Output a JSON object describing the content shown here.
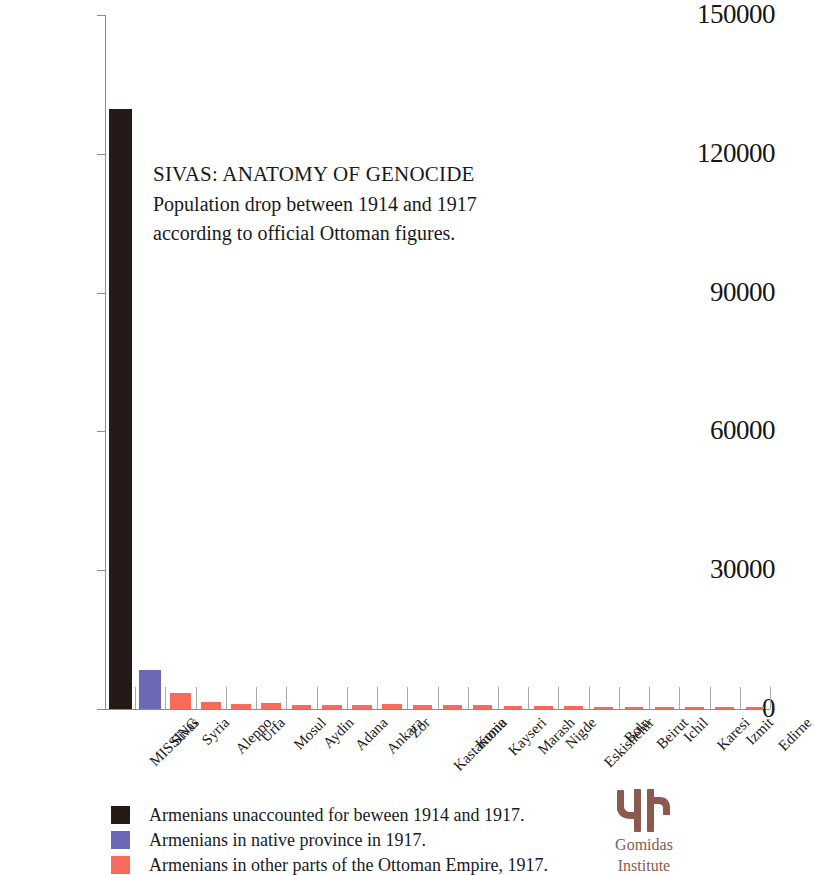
{
  "chart_data": {
    "type": "bar",
    "title": "SIVAS: ANATOMY OF GENOCIDE",
    "subtitle_lines": [
      "Population drop between 1914 and 1917",
      "according to official Ottoman figures."
    ],
    "xlabel": "",
    "ylabel": "",
    "ylim": [
      0,
      150000
    ],
    "ytick_values": [
      0,
      30000,
      60000,
      90000,
      120000,
      150000
    ],
    "ytick_labels": [
      "0",
      "30000",
      "60000",
      "90000",
      "120000",
      "150000"
    ],
    "grid": false,
    "legend_position": "below-left",
    "categories": [
      "MISSING",
      "Sivas",
      "Syria",
      "Aleppo",
      "Urfa",
      "Mosul",
      "Aydin",
      "Adana",
      "Ankara",
      "Zor",
      "Kastamonu",
      "Konia",
      "Kayseri",
      "Marash",
      "Nigde",
      "Eskishehir",
      "Bolu",
      "Beirut",
      "Ichil",
      "Karesi",
      "Izmit",
      "Edirne"
    ],
    "values": [
      129700,
      8400,
      3500,
      1500,
      1100,
      1300,
      900,
      900,
      800,
      1000,
      800,
      800,
      900,
      700,
      600,
      600,
      500,
      500,
      400,
      400,
      350,
      300
    ],
    "bar_series_index": [
      0,
      1,
      2,
      2,
      2,
      2,
      2,
      2,
      2,
      2,
      2,
      2,
      2,
      2,
      2,
      2,
      2,
      2,
      2,
      2,
      2,
      2
    ],
    "series": [
      {
        "name": "Armenians unaccounted for beween 1914 and 1917.",
        "color": "#251a18"
      },
      {
        "name": "Armenians in native province in 1917.",
        "color": "#6b68b8"
      },
      {
        "name": "Armenians in other parts of the Ottoman Empire, 1917.",
        "color": "#f86a5c"
      }
    ]
  },
  "legend": {
    "items": [
      {
        "label": "Armenians unaccounted for beween 1914 and 1917.",
        "color": "#251a18"
      },
      {
        "label": "Armenians in native province in 1917.",
        "color": "#6b68b8"
      },
      {
        "label": "Armenians in other parts of the Ottoman Empire, 1917.",
        "color": "#f86a5c"
      }
    ]
  },
  "logo": {
    "name_line1": "Gomidas",
    "name_line2": "Institute",
    "color": "#8a5a4e"
  },
  "colors": {
    "axis": "#8c8c8c",
    "tick": "#a8a8a8",
    "text": "#1a1a1a",
    "background": "#ffffff"
  }
}
